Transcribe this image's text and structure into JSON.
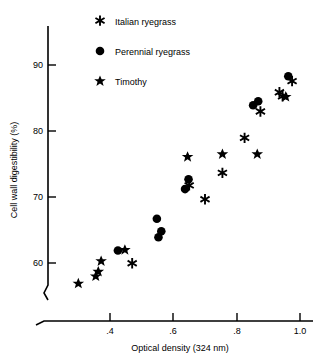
{
  "chart_data": {
    "type": "scatter",
    "title": "",
    "xlabel": "Optical density (324 nm)",
    "ylabel": "Cell wall digestibility (%)",
    "xlim": [
      0.26,
      1.04
    ],
    "ylim": [
      55.5,
      92.5
    ],
    "xticks": [
      0.4,
      0.6,
      0.8,
      1.0
    ],
    "xticklabels": [
      ".4",
      ".6",
      ".8",
      "1.0"
    ],
    "yticks": [
      60,
      70,
      80,
      90
    ],
    "yticklabels": [
      "60",
      "70",
      "80",
      "90"
    ],
    "grid": false,
    "axis_break_x": true,
    "axis_break_y": true,
    "legend_position": "top-left-inside",
    "series": [
      {
        "name": "Italian ryegrass",
        "marker": "asterisk",
        "color": "#000000",
        "points": [
          [
            0.47,
            59.9
          ],
          [
            0.65,
            71.7
          ],
          [
            0.7,
            69.6
          ],
          [
            0.755,
            73.6
          ],
          [
            0.825,
            78.9
          ],
          [
            0.875,
            82.9
          ],
          [
            0.935,
            85.8
          ],
          [
            0.945,
            85.2
          ],
          [
            0.975,
            87.5
          ]
        ]
      },
      {
        "name": "Perennial ryegrass",
        "marker": "circle",
        "color": "#000000",
        "points": [
          [
            0.425,
            61.9
          ],
          [
            0.548,
            66.7
          ],
          [
            0.553,
            63.9
          ],
          [
            0.562,
            64.8
          ],
          [
            0.637,
            71.2
          ],
          [
            0.648,
            72.7
          ],
          [
            0.852,
            83.9
          ],
          [
            0.868,
            84.5
          ],
          [
            0.963,
            88.3
          ]
        ]
      },
      {
        "name": "Timothy",
        "marker": "star",
        "color": "#000000",
        "points": [
          [
            0.3,
            56.9
          ],
          [
            0.355,
            58.0
          ],
          [
            0.363,
            58.7
          ],
          [
            0.372,
            60.3
          ],
          [
            0.447,
            62.0
          ],
          [
            0.645,
            76.1
          ],
          [
            0.755,
            76.5
          ],
          [
            0.865,
            76.5
          ],
          [
            0.955,
            85.2
          ]
        ]
      }
    ]
  },
  "legend": {
    "items": [
      {
        "label": "Italian ryegrass",
        "marker": "asterisk"
      },
      {
        "label": "Perennial ryegrass",
        "marker": "circle"
      },
      {
        "label": "Timothy",
        "marker": "star"
      }
    ]
  }
}
